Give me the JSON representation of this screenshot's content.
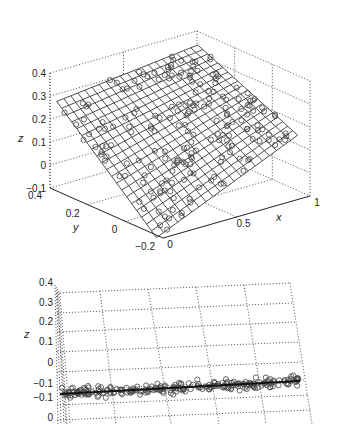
{
  "chart_data": [
    {
      "panel": "top",
      "type": "surface3d",
      "title": "",
      "xlabel": "x",
      "ylabel": "y",
      "zlabel": "z",
      "xlim": [
        0,
        1
      ],
      "ylim": [
        -0.2,
        0.4
      ],
      "zlim": [
        -0.1,
        0.4
      ],
      "x_ticks": [
        "0",
        "0.5",
        "1"
      ],
      "y_ticks": [
        "0.4",
        "0.2",
        "0",
        "-0.2"
      ],
      "z_ticks": [
        "0.4",
        "0.3",
        "0.2",
        "0.1",
        "0",
        "-0.1"
      ],
      "grid": true,
      "surface": {
        "description": "fitted plane mesh, tilted, rising toward high x / low y",
        "mesh_lines": 20
      },
      "scatter": {
        "marker": "open-circle",
        "count_approx": 200
      }
    },
    {
      "panel": "bottom",
      "type": "scatter3d",
      "title": "",
      "zlabel": "z",
      "z_ticks": [
        "0.4",
        "0.3",
        "0.2",
        "0.1",
        "0",
        "-0.1",
        "-0.1",
        "0"
      ],
      "grid": true,
      "view": "edge-on view of the fitted plane",
      "fit_line": {
        "from_z": -0.13,
        "to_z": -0.08
      },
      "scatter": {
        "marker": "open-circle",
        "count_approx": 200
      }
    }
  ],
  "labels": {
    "top_x": "x",
    "top_y": "y",
    "top_z": "z",
    "bottom_z": "z"
  }
}
